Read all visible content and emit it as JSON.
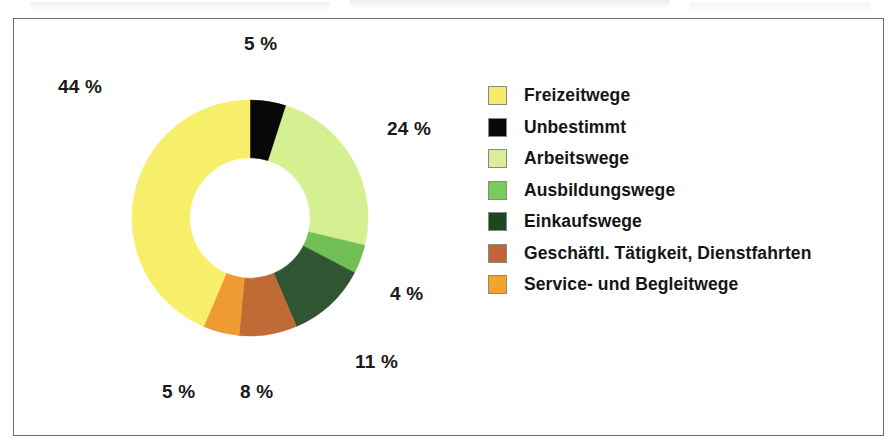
{
  "figure": {
    "background_color": "#ffffff",
    "frame_border_color": "#6b6b6b"
  },
  "chart_data": {
    "type": "pie",
    "variant": "donut",
    "title": "",
    "subtitle": "",
    "xlabel": "",
    "ylabel": "",
    "grid": false,
    "legend_position": "right",
    "value_unit": "%",
    "data_label_format": "{value} %",
    "start_angle_deg": 0,
    "direction": "clockwise",
    "inner_radius_ratio": 0.51,
    "labels": [
      "Freizeitwege",
      "Unbestimmt",
      "Arbeitswege",
      "Ausbildungswege",
      "Einkaufswege",
      "Geschäftl. Tätigkeit, Dienstfahrten",
      "Service- und Begleitwege"
    ],
    "values": [
      44,
      5,
      24,
      4,
      11,
      8,
      5
    ],
    "colors": [
      "#f7ee6a",
      "#080808",
      "#d5f090",
      "#70c056",
      "#2f5532",
      "#c06a35",
      "#f09a33"
    ],
    "slice_order_clockwise_from_top": [
      {
        "label": "Unbestimmt",
        "value": 5,
        "color": "#080808"
      },
      {
        "label": "Arbeitswege",
        "value": 24,
        "color": "#d5f090"
      },
      {
        "label": "Ausbildungswege",
        "value": 4,
        "color": "#70c056"
      },
      {
        "label": "Einkaufswege",
        "value": 11,
        "color": "#2f5532"
      },
      {
        "label": "Geschäftl. Tätigkeit, Dienstfahrten",
        "value": 8,
        "color": "#c06a35"
      },
      {
        "label": "Service- und Begleitwege",
        "value": 5,
        "color": "#f09a33"
      },
      {
        "label": "Freizeitwege",
        "value": 44,
        "color": "#f7ee6a"
      }
    ],
    "data_labels": [
      {
        "text": "5 %",
        "for": "Unbestimmt",
        "x": 244,
        "y": 33
      },
      {
        "text": "24 %",
        "for": "Arbeitswege",
        "x": 387,
        "y": 118
      },
      {
        "text": "4 %",
        "for": "Ausbildungswege",
        "x": 390,
        "y": 283
      },
      {
        "text": "11 %",
        "for": "Einkaufswege",
        "x": 355,
        "y": 351
      },
      {
        "text": "8 %",
        "for": "Geschäftl. Tätigkeit, Dienstfahrten",
        "x": 240,
        "y": 381
      },
      {
        "text": "5 %",
        "for": "Service- und Begleitwege",
        "x": 162,
        "y": 381
      },
      {
        "text": "44 %",
        "for": "Freizeitwege",
        "x": 58,
        "y": 76
      }
    ]
  },
  "legend": {
    "items": [
      {
        "label": "Freizeitwege",
        "color": "#f5ec6e"
      },
      {
        "label": "Unbestimmt",
        "color": "#090909"
      },
      {
        "label": "Arbeitswege",
        "color": "#d8ee9a"
      },
      {
        "label": "Ausbildungswege",
        "color": "#77cc5c"
      },
      {
        "label": "Einkaufswege",
        "color": "#1e4620"
      },
      {
        "label": "Geschäftl. Tätigkeit, Dienstfahrten",
        "color": "#c0643c"
      },
      {
        "label": "Service- und Begleitwege",
        "color": "#f0a52e"
      }
    ]
  }
}
